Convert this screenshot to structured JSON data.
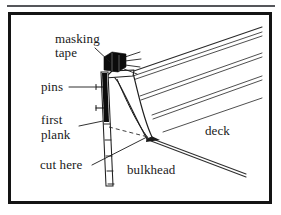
{
  "figure": {
    "type": "line-drawing",
    "border_color": "#141414",
    "rule_color": "#55565a",
    "ink_color": "#1a1a1a",
    "background": "#ffffff"
  },
  "labels": {
    "masking_tape_line1": "masking",
    "masking_tape_line2": "tape",
    "pins": "pins",
    "first_plank_line1": "first",
    "first_plank_line2": "plank",
    "cut_here": "cut here",
    "bulkhead": "bulkhead",
    "deck": "deck"
  },
  "parts": [
    {
      "name": "masking-tape",
      "label": "masking tape",
      "shape": "solid black wedge at top of bulkhead"
    },
    {
      "name": "pins",
      "label": "pins",
      "shape": "two T-shaped pins through first plank"
    },
    {
      "name": "first-plank",
      "label": "first plank",
      "shape": "vertical strip on bulkhead face"
    },
    {
      "name": "cut-here",
      "label": "cut here",
      "shape": "leader line to plank end"
    },
    {
      "name": "bulkhead",
      "label": "bulkhead",
      "shape": "curved vertical former"
    },
    {
      "name": "deck",
      "label": "deck",
      "shape": "diagonal planked surface"
    }
  ],
  "leaders": [
    {
      "from": "masking-tape",
      "to": "tape-wedge"
    },
    {
      "from": "pins",
      "to": "pin-heads"
    },
    {
      "from": "first-plank",
      "to": "plank-strip"
    },
    {
      "from": "cut-here",
      "to": "plank-end"
    }
  ]
}
